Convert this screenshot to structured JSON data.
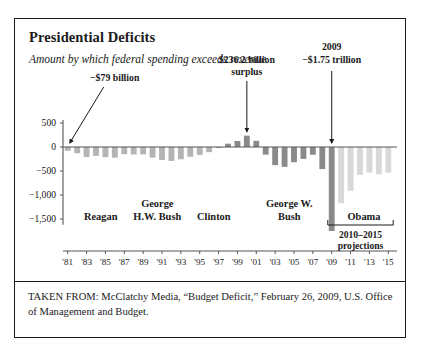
{
  "title": "Presidential Deficits",
  "subtitle": "Amount by which federal spending exceeds revenue",
  "source": "TAKEN FROM: McClatchy Media, “Budget Deficit,” February 26, 2009, U.S. Office of Management and Budget.",
  "colors": {
    "bar_historic": "#b4b4b4",
    "bar_bush": "#8a8a8a",
    "bar_projection": "#d8d8d8",
    "axis": "#555555",
    "text": "#1a1a1a",
    "frame": "#1a1a1a"
  },
  "chart_data": {
    "type": "bar",
    "title": "Presidential Deficits",
    "subtitle": "Amount by which federal spending exceeds revenue",
    "xlabel": "",
    "ylabel": "",
    "unit": "billions of dollars",
    "ylim": [
      -1800,
      600
    ],
    "yticks": [
      500,
      0,
      -500,
      -1000,
      -1500
    ],
    "ytick_labels": [
      "500",
      "0",
      "−500",
      "−1,000",
      "−1,500"
    ],
    "grid": false,
    "legend": "none",
    "x": [
      1981,
      1982,
      1983,
      1984,
      1985,
      1986,
      1987,
      1988,
      1989,
      1990,
      1991,
      1992,
      1993,
      1994,
      1995,
      1996,
      1997,
      1998,
      1999,
      2000,
      2001,
      2002,
      2003,
      2004,
      2005,
      2006,
      2007,
      2008,
      2009,
      2010,
      2011,
      2012,
      2013,
      2014,
      2015
    ],
    "xtick_labels": [
      "'81",
      "'83",
      "'85",
      "'87",
      "'89",
      "'91",
      "'93",
      "'95",
      "'97",
      "'99",
      "'01",
      "'03",
      "'05",
      "'07",
      "'09",
      "'11",
      "'13",
      "'15"
    ],
    "xtick_years": [
      1981,
      1983,
      1985,
      1987,
      1989,
      1991,
      1993,
      1995,
      1997,
      1999,
      2001,
      2003,
      2005,
      2007,
      2009,
      2011,
      2013,
      2015
    ],
    "values": [
      -79,
      -128,
      -208,
      -185,
      -212,
      -221,
      -150,
      -155,
      -153,
      -221,
      -269,
      -290,
      -255,
      -203,
      -164,
      -107,
      -22,
      69,
      126,
      236,
      128,
      -158,
      -378,
      -413,
      -318,
      -248,
      -161,
      -459,
      -1750,
      -1170,
      -912,
      -581,
      -533,
      -570,
      -533
    ],
    "series": [
      {
        "name": "Deficit / surplus",
        "values": [
          -79,
          -128,
          -208,
          -185,
          -212,
          -221,
          -150,
          -155,
          -153,
          -221,
          -269,
          -290,
          -255,
          -203,
          -164,
          -107,
          -22,
          69,
          126,
          236,
          128,
          -158,
          -378,
          -413,
          -318,
          -248,
          -161,
          -459,
          -1750,
          -1170,
          -912,
          -581,
          -533,
          -570,
          -533
        ]
      }
    ],
    "bar_styles": [
      "historic",
      "historic",
      "historic",
      "historic",
      "historic",
      "historic",
      "historic",
      "historic",
      "historic",
      "historic",
      "historic",
      "historic",
      "historic",
      "historic",
      "historic",
      "historic",
      "historic",
      "bush",
      "bush",
      "bush",
      "bush",
      "bush",
      "bush",
      "bush",
      "bush",
      "bush",
      "bush",
      "bush",
      "bush",
      "projection",
      "projection",
      "projection",
      "projection",
      "projection",
      "projection"
    ],
    "annotations": [
      {
        "id": "deficit-1981",
        "text": "−$79 billion",
        "target_year": 1981,
        "target_value": -79
      },
      {
        "id": "surplus-2000",
        "text_line1": "$236.2 billion",
        "text_line2": "surplus",
        "target_year": 2000,
        "target_value": 236
      },
      {
        "id": "deficit-2009",
        "text_line1": "2009",
        "text_line2": "−$1.75 trillion",
        "target_year": 2009,
        "target_value": -1750
      }
    ],
    "presidents": [
      {
        "name": "Reagan",
        "start": 1981,
        "end": 1988
      },
      {
        "name_line1": "George",
        "name_line2": "H.W. Bush",
        "name": "George H.W. Bush",
        "start": 1989,
        "end": 1992
      },
      {
        "name": "Clinton",
        "start": 1993,
        "end": 2000
      },
      {
        "name_line1": "George W.",
        "name_line2": "Bush",
        "name": "George W. Bush",
        "start": 2001,
        "end": 2008
      },
      {
        "name": "Obama",
        "start": 2009,
        "end": 2015
      }
    ],
    "projection_note_line1": "2010–2015",
    "projection_note_line2": "projections"
  }
}
